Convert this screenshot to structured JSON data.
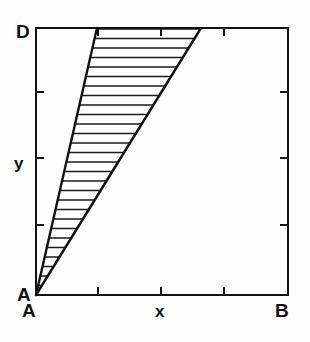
{
  "figure": {
    "kind": "hatched-wedge-diagram",
    "background_color": "#fefefe",
    "line_color": "#111111",
    "fill_color": "#ffffff",
    "hatch_color": "#1a1a1a"
  },
  "labels": {
    "top_left_corner": "D",
    "origin_left": "A",
    "origin_below": "A",
    "bottom_right_corner": "B",
    "y_axis": "y",
    "x_axis": "x"
  },
  "chart_data": {
    "type": "area",
    "title": "",
    "xlabel": "x",
    "ylabel": "y",
    "grid": false,
    "legend": null,
    "annotations": [
      "D",
      "A",
      "A",
      "B"
    ],
    "plot_box": {
      "left": 36,
      "top": 28,
      "right": 288,
      "bottom": 295,
      "border_width": 2
    },
    "axis_ticks": {
      "x_positions": [
        98,
        161,
        224
      ],
      "x_tick_length": 8,
      "x_labels": [
        "",
        "",
        ""
      ],
      "y_positions": [
        92,
        158,
        225
      ],
      "y_tick_length": 8,
      "y_labels": [
        "",
        "",
        ""
      ],
      "ticks_on_all_four_sides": true,
      "tick_direction": "inward"
    },
    "series": [
      {
        "name": "left-boundary",
        "description": "straight line from origin A to upper-left apex",
        "points": [
          [
            36,
            295
          ],
          [
            97,
            28
          ]
        ]
      },
      {
        "name": "right-boundary",
        "description": "straight line from origin A to upper-right apex",
        "points": [
          [
            36,
            295
          ],
          [
            201,
            28
          ]
        ]
      },
      {
        "name": "top-boundary",
        "description": "segment of the top frame closing the wedge",
        "points": [
          [
            97,
            28
          ],
          [
            201,
            28
          ]
        ]
      }
    ],
    "hatching": {
      "orientation": "horizontal",
      "spacing_px": 9.5,
      "stroke_width": 1.6,
      "count": 28
    }
  }
}
